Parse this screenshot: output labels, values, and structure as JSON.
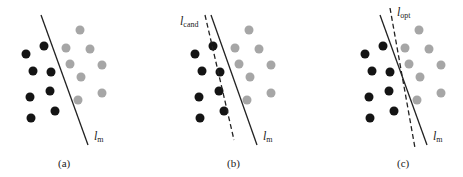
{
  "colors": {
    "class_a": "#141414",
    "class_b": "#a6a6a6",
    "line": "#222222"
  },
  "panels": [
    {
      "id": "a",
      "caption": "(a)",
      "offset": 0,
      "solid_label": "l",
      "solid_sub": "m",
      "dashed": null
    },
    {
      "id": "b",
      "caption": "(b)",
      "offset": 169,
      "solid_label": "l",
      "solid_sub": "m",
      "dashed_label": "l",
      "dashed_sub": "cand"
    },
    {
      "id": "c",
      "caption": "(c)",
      "offset": 339,
      "solid_label": "l",
      "solid_sub": "m",
      "dashed_label": "l",
      "dashed_sub": "opt"
    }
  ],
  "black_points": [
    [
      26,
      54
    ],
    [
      44,
      46
    ],
    [
      33,
      71
    ],
    [
      51,
      72
    ],
    [
      30,
      97
    ],
    [
      50,
      91
    ],
    [
      31,
      118
    ],
    [
      55,
      111
    ]
  ],
  "gray_points": [
    [
      80,
      30
    ],
    [
      66,
      48
    ],
    [
      90,
      49
    ],
    [
      70,
      64
    ],
    [
      102,
      65
    ],
    [
      81,
      77
    ],
    [
      102,
      93
    ],
    [
      78,
      100
    ]
  ]
}
